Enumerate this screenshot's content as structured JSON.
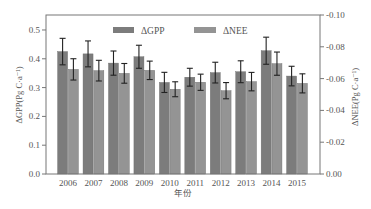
{
  "chart_data": {
    "type": "bar",
    "title": "",
    "xlabel": "年份",
    "ylabel": "ΔGPP(Pg C·a⁻¹)",
    "ylabel_right": "ΔNEE(Pg C·a⁻¹)",
    "categories": [
      "2006",
      "2007",
      "2008",
      "2009",
      "2010",
      "2011",
      "2012",
      "2013",
      "2014",
      "2015"
    ],
    "series": [
      {
        "name": "ΔGPP",
        "axis": "left",
        "color": "#7c7c7c",
        "values": [
          0.425,
          0.417,
          0.385,
          0.407,
          0.318,
          0.336,
          0.352,
          0.355,
          0.428,
          0.34
        ],
        "errors": [
          0.046,
          0.045,
          0.042,
          0.04,
          0.035,
          0.031,
          0.036,
          0.038,
          0.047,
          0.034
        ]
      },
      {
        "name": "ΔNEE",
        "axis": "right",
        "color": "#949494",
        "values": [
          -0.0658,
          -0.065,
          -0.0633,
          -0.0652,
          -0.0533,
          -0.0577,
          -0.0524,
          -0.0581,
          -0.0694,
          -0.057
        ],
        "errors": [
          0.0067,
          0.0065,
          0.0062,
          0.0058,
          0.0047,
          0.0051,
          0.0051,
          0.0058,
          0.0073,
          0.006
        ]
      }
    ],
    "ylim": [
      0,
      0.552
    ],
    "ylim_right": [
      0,
      -0.1
    ],
    "yticks": [
      "0.0",
      "0.1",
      "0.2",
      "0.3",
      "0.4",
      "0.5"
    ],
    "yticks_right": [
      "0.00",
      "-0.02",
      "-0.04",
      "-0.06",
      "-0.08",
      "-0.10"
    ],
    "yticks_values": [
      0,
      0.1,
      0.2,
      0.3,
      0.4,
      0.5
    ],
    "yticks_right_values": [
      0,
      -0.02,
      -0.04,
      -0.06,
      -0.08,
      -0.1
    ],
    "grid": false,
    "legend": {
      "placement": "top",
      "entries": [
        "ΔGPP",
        "ΔNEE"
      ]
    },
    "error_bars": true,
    "error_bar_color": "#222222",
    "axis_color": "#777777"
  }
}
